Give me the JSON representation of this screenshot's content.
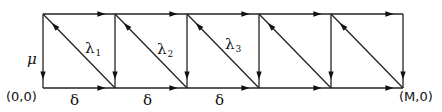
{
  "diagram": {
    "type": "state-transition-lattice",
    "columns_x": [
      43,
      115,
      187,
      259,
      331,
      403
    ],
    "top_y": 14,
    "bottom_y": 88,
    "line_color": "#222222",
    "edges": {
      "top": "right-arrow",
      "bottom": "right-arrow",
      "vertical": "down-arrow",
      "diagonal": "up-left-arrow"
    },
    "labels": {
      "origin": "(0,0)",
      "end": "(M,0)",
      "mu": "μ",
      "deltas": [
        "δ",
        "δ",
        "δ"
      ],
      "lambdas": [
        {
          "symbol": "λ",
          "sub": "1"
        },
        {
          "symbol": "λ",
          "sub": "2"
        },
        {
          "symbol": "λ",
          "sub": "3"
        }
      ]
    }
  }
}
